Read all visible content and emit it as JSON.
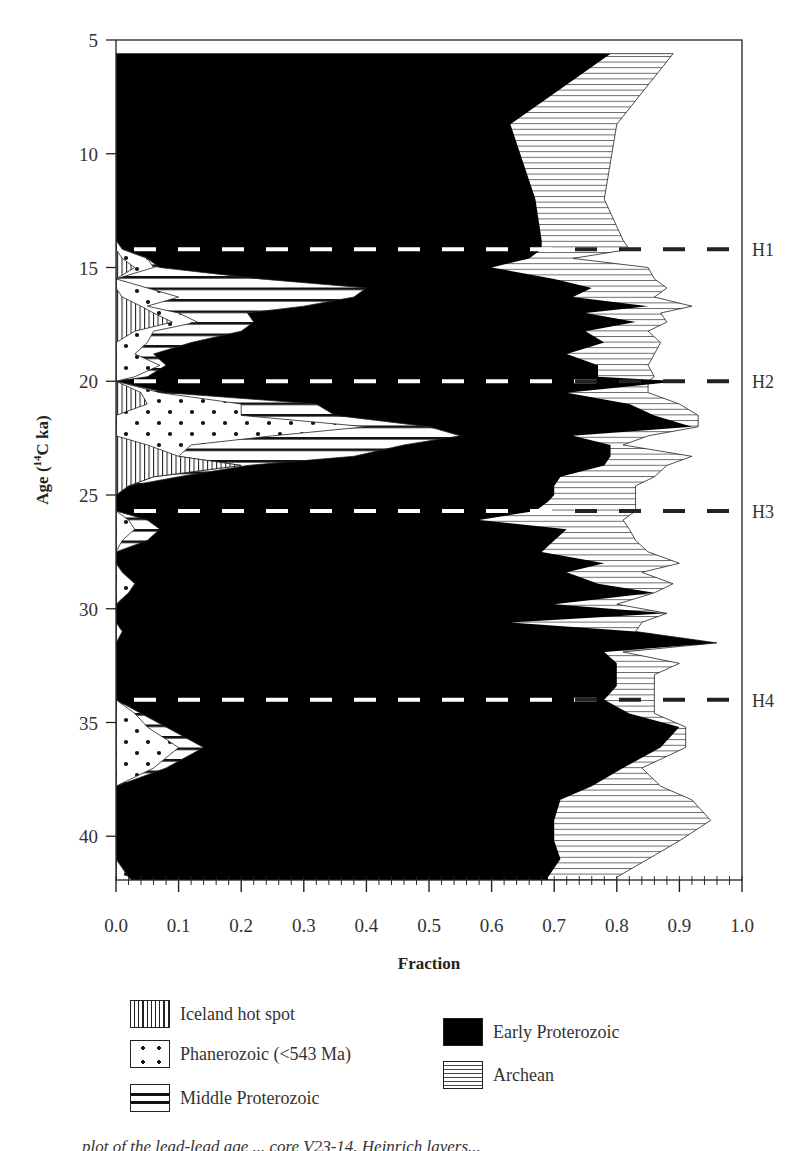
{
  "chart_data": {
    "type": "area",
    "subtype": "stacked-horizontal-area",
    "title": "",
    "xlabel": "Fraction",
    "ylabel": "Age (14C ka)",
    "ylabel_display": {
      "prefix": "Age (",
      "sup": "14",
      "suffix": "C ka)"
    },
    "xlim": [
      0.0,
      1.0
    ],
    "ylim": [
      5,
      42.8
    ],
    "y_inverted": true,
    "x_ticks": [
      "0.0",
      "0.1",
      "0.2",
      "0.3",
      "0.4",
      "0.5",
      "0.6",
      "0.7",
      "0.8",
      "0.9",
      "1.0"
    ],
    "y_ticks": [
      "5",
      "10",
      "15",
      "20",
      "25",
      "30",
      "35",
      "40"
    ],
    "grid": false,
    "legend_position": "below",
    "heinrich_events": [
      {
        "label": "H1",
        "age": 14.2
      },
      {
        "label": "H2",
        "age": 20.0
      },
      {
        "label": "H3",
        "age": 25.7
      },
      {
        "label": "H4",
        "age": 34.0
      }
    ],
    "series_order": [
      "Iceland hot spot",
      "Phanerozoic (<543 Ma)",
      "Middle Proterozoic",
      "Early Proterozoic",
      "Archean"
    ],
    "ages": [
      5.6,
      8.7,
      12.0,
      13.8,
      14.2,
      14.6,
      15.0,
      15.5,
      15.9,
      16.3,
      16.7,
      17.0,
      17.4,
      17.8,
      18.3,
      18.8,
      19.3,
      19.8,
      20.0,
      20.5,
      21.0,
      21.5,
      22.0,
      22.4,
      22.8,
      23.3,
      23.7,
      24.2,
      24.6,
      25.0,
      25.3,
      25.7,
      26.1,
      26.5,
      27.0,
      27.5,
      28.0,
      28.4,
      28.9,
      29.3,
      29.8,
      30.2,
      30.6,
      31.0,
      31.5,
      31.9,
      32.4,
      32.9,
      33.4,
      34.0,
      34.6,
      35.2,
      36.1,
      37.0,
      37.8,
      38.4,
      39.3,
      40.2,
      41.0,
      41.8,
      42.6
    ],
    "cumulative": {
      "Iceland hot spot": [
        0.0,
        0.0,
        0.0,
        0.0,
        0.0,
        0.01,
        0.03,
        0.0,
        0.0,
        0.01,
        0.04,
        0.06,
        0.09,
        0.03,
        0.0,
        0.0,
        0.0,
        0.0,
        0.0,
        0.04,
        0.05,
        0.0,
        0.0,
        0.0,
        0.05,
        0.1,
        0.2,
        0.06,
        0.02,
        0.0,
        0.0,
        0.0,
        0.0,
        0.0,
        0.0,
        0.0,
        0.0,
        0.0,
        0.0,
        0.0,
        0.0,
        0.0,
        0.0,
        0.0,
        0.0,
        0.0,
        0.0,
        0.0,
        0.0,
        0.0,
        0.0,
        0.0,
        0.0,
        0.0,
        0.0,
        0.0,
        0.0,
        0.0,
        0.0,
        0.0,
        0.0
      ],
      "Phanerozoic (<543 Ma)": [
        0.0,
        0.0,
        0.0,
        0.0,
        0.01,
        0.05,
        0.06,
        0.0,
        0.05,
        0.1,
        0.05,
        0.1,
        0.13,
        0.06,
        0.05,
        0.03,
        0.07,
        0.03,
        0.0,
        0.07,
        0.2,
        0.2,
        0.4,
        0.25,
        0.12,
        0.1,
        0.2,
        0.06,
        0.02,
        0.0,
        0.0,
        0.0,
        0.02,
        0.03,
        0.01,
        0.0,
        0.0,
        0.01,
        0.03,
        0.02,
        0.0,
        0.0,
        0.0,
        0.01,
        0.0,
        0.0,
        0.0,
        0.0,
        0.0,
        0.0,
        0.03,
        0.05,
        0.1,
        0.06,
        0.0,
        0.0,
        0.0,
        0.0,
        0.0,
        0.02,
        0.05
      ],
      "Middle Proterozoic": [
        0.0,
        0.0,
        0.0,
        0.0,
        0.01,
        0.05,
        0.07,
        0.23,
        0.4,
        0.38,
        0.3,
        0.21,
        0.22,
        0.2,
        0.12,
        0.06,
        0.08,
        0.05,
        0.0,
        0.08,
        0.32,
        0.35,
        0.5,
        0.55,
        0.46,
        0.38,
        0.21,
        0.1,
        0.02,
        0.0,
        0.0,
        0.0,
        0.05,
        0.07,
        0.05,
        0.0,
        0.0,
        0.01,
        0.03,
        0.02,
        0.0,
        0.0,
        0.0,
        0.01,
        0.0,
        0.0,
        0.0,
        0.0,
        0.0,
        0.0,
        0.04,
        0.08,
        0.14,
        0.08,
        0.0,
        0.0,
        0.0,
        0.0,
        0.0,
        0.02,
        0.05
      ],
      "Early Proterozoic": [
        0.79,
        0.63,
        0.67,
        0.68,
        0.68,
        0.66,
        0.6,
        0.7,
        0.76,
        0.73,
        0.85,
        0.75,
        0.83,
        0.75,
        0.78,
        0.72,
        0.77,
        0.77,
        0.9,
        0.72,
        0.82,
        0.86,
        0.92,
        0.73,
        0.79,
        0.79,
        0.78,
        0.71,
        0.7,
        0.7,
        0.69,
        0.67,
        0.58,
        0.72,
        0.7,
        0.68,
        0.78,
        0.72,
        0.77,
        0.86,
        0.7,
        0.88,
        0.63,
        0.83,
        0.96,
        0.78,
        0.8,
        0.8,
        0.8,
        0.78,
        0.82,
        0.9,
        0.87,
        0.81,
        0.76,
        0.71,
        0.7,
        0.7,
        0.71,
        0.69,
        0.69
      ],
      "Archean": [
        0.89,
        0.8,
        0.78,
        0.81,
        0.82,
        0.73,
        0.85,
        0.86,
        0.88,
        0.86,
        0.92,
        0.87,
        0.88,
        0.85,
        0.87,
        0.86,
        0.85,
        0.86,
        0.85,
        0.85,
        0.9,
        0.93,
        0.93,
        0.85,
        0.81,
        0.92,
        0.88,
        0.86,
        0.83,
        0.83,
        0.83,
        0.83,
        0.81,
        0.82,
        0.83,
        0.85,
        0.9,
        0.84,
        0.89,
        0.86,
        0.8,
        0.88,
        0.84,
        0.83,
        0.96,
        0.81,
        0.9,
        0.86,
        0.86,
        0.86,
        0.86,
        0.91,
        0.91,
        0.84,
        0.87,
        0.92,
        0.95,
        0.9,
        0.85,
        0.8,
        0.8
      ]
    }
  },
  "legend": {
    "items": [
      {
        "label": "Iceland hot spot",
        "pattern": "vertical-lines"
      },
      {
        "label": "Phanerozoic (<543 Ma)",
        "pattern": "dots"
      },
      {
        "label": "Middle Proterozoic",
        "pattern": "thick-horizontal-lines"
      },
      {
        "label": "Early Proterozoic",
        "pattern": "solid-black"
      },
      {
        "label": "Archean",
        "pattern": "thin-horizontal-lines"
      }
    ]
  },
  "caption": {
    "text": "plot of the lead-lead age ... core V23-14. Heinrich layers..."
  },
  "colors": {
    "ink": "#000000",
    "background": "#ffffff",
    "dash_on_black": "#ffffff",
    "dash_on_white": "#222222"
  }
}
